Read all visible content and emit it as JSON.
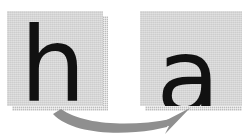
{
  "canvas": {
    "width": 242,
    "height": 139,
    "background": "#ffffff"
  },
  "diagram": {
    "type": "letter-transformation",
    "arrow": {
      "name": "curved-right-arrow",
      "direction": "left-to-right",
      "shape": "curved",
      "color": "#8f8f8f"
    },
    "tiles": [
      {
        "id": "tile-h",
        "letter": "h",
        "role": "source",
        "face_color": "#d2d2d2",
        "shadow_color": "#b9b9b9",
        "text_color": "#111111"
      },
      {
        "id": "tile-a",
        "letter": "a",
        "role": "target",
        "face_color": "#d2d2d2",
        "shadow_color": "#b9b9b9",
        "text_color": "#111111"
      }
    ]
  }
}
